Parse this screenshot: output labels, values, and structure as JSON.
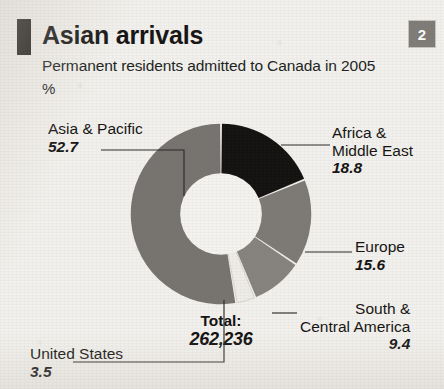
{
  "header": {
    "title": "Asian arrivals",
    "subtitle": "Permanent residents admitted to Canada in 2005",
    "unit": "%",
    "badge": "2"
  },
  "center": {
    "total_label": "Total:",
    "total_value": "262,236"
  },
  "colors": {
    "africa": "#131211",
    "europe": "#7d7a75",
    "south": "#86837e",
    "united_states": "#eeece8",
    "asia": "#767370",
    "background": "#f2f0ec",
    "text": "#151413",
    "badge_bg": "#7f7b76"
  },
  "chart_data": {
    "type": "pie",
    "title": "Asian arrivals",
    "subtitle": "Permanent residents admitted to Canada in 2005",
    "ylabel": "%",
    "total_label": "Total:",
    "total_value": "262,236",
    "total_number": 262236,
    "unit": "%",
    "donut": true,
    "start_angle_deg": 0,
    "direction": "clockwise",
    "categories": [
      "Africa & Middle East",
      "Europe",
      "South & Central America",
      "United States",
      "Asia & Pacific"
    ],
    "values": [
      18.8,
      15.6,
      9.4,
      3.5,
      52.7
    ],
    "slices": [
      {
        "label": "Africa & Middle East",
        "label_line1": "Africa &",
        "label_line2": "Middle East",
        "value": 18.8,
        "value_text": "18.8",
        "color": "#131211"
      },
      {
        "label": "Europe",
        "label_line1": "Europe",
        "label_line2": "",
        "value": 15.6,
        "value_text": "15.6",
        "color": "#7d7a75"
      },
      {
        "label": "South & Central America",
        "label_line1": "South &",
        "label_line2": "Central America",
        "value": 9.4,
        "value_text": "9.4",
        "color": "#86837e"
      },
      {
        "label": "United States",
        "label_line1": "United States",
        "label_line2": "",
        "value": 3.5,
        "value_text": "3.5",
        "color": "#eeece8"
      },
      {
        "label": "Asia & Pacific",
        "label_line1": "Asia & Pacific",
        "label_line2": "",
        "value": 52.7,
        "value_text": "52.7",
        "color": "#767370"
      }
    ],
    "legend": "callout-labels",
    "grid": false
  }
}
